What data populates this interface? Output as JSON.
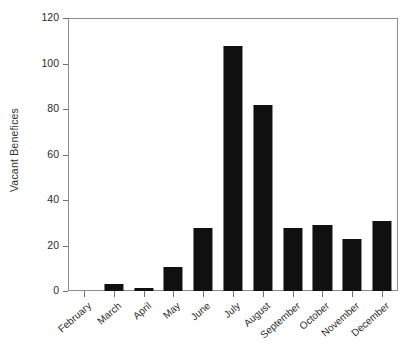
{
  "chart_data": {
    "type": "bar",
    "title": "",
    "xlabel": "",
    "ylabel": "Vacant Benefices",
    "categories": [
      "February",
      "March",
      "April",
      "May",
      "June",
      "July",
      "August",
      "September",
      "October",
      "November",
      "December"
    ],
    "values": [
      0,
      3,
      1.5,
      10.5,
      28,
      108,
      82,
      28,
      29,
      23,
      31
    ],
    "ylim": [
      0,
      120
    ],
    "yticks": [
      0,
      20,
      40,
      60,
      80,
      100,
      120
    ],
    "ytick_labels": [
      "0",
      "20",
      "40",
      "60",
      "80",
      "100",
      "120"
    ],
    "grid": false,
    "legend": false,
    "bar_color": "#101010",
    "frame_color": "#8d8d8d",
    "background_color": "#ffffff"
  }
}
